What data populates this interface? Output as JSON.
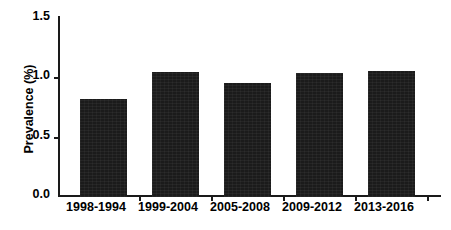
{
  "chart_data": {
    "type": "bar",
    "title": "",
    "xlabel": "",
    "ylabel": "Prevalence (%)",
    "categories": [
      "1998-1994",
      "1999-2004",
      "2005-2008",
      "2009-2012",
      "2013-2016"
    ],
    "values": [
      0.81,
      1.03,
      0.94,
      1.02,
      1.04
    ],
    "ylim": [
      0.0,
      1.5
    ],
    "yticks": [
      0.0,
      0.5,
      1.0,
      1.5
    ],
    "ytick_labels": [
      "0.0",
      "0.5",
      "1.0",
      "1.5"
    ],
    "grid": false,
    "legend": null,
    "legend_position": "none",
    "series": [
      {
        "name": "Prevalence",
        "values": [
          0.81,
          1.03,
          0.94,
          1.02,
          1.04
        ],
        "color": "#1b1b1b"
      }
    ],
    "bar_color": "#1b1b1b",
    "axis_color": "#1a1a1a",
    "background": "#ffffff"
  },
  "axes": {
    "y_title": "Prevalence (%)",
    "y_tick_labels": [
      "1.5",
      "1.0",
      "0.5",
      "0.0"
    ],
    "x_tick_labels": [
      "1998-1994",
      "1999-2004",
      "2005-2008",
      "2009-2012",
      "2013-2016"
    ]
  },
  "caption": {
    "text": ""
  }
}
